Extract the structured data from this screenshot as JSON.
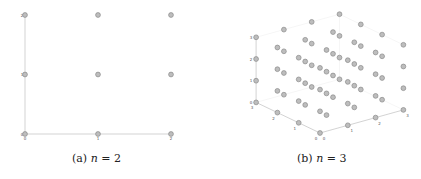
{
  "figure": {
    "panels": [
      {
        "id": "a",
        "caption_prefix": "(a)",
        "caption_var": "n",
        "caption_eq": " = 2"
      },
      {
        "id": "b",
        "caption_prefix": "(b)",
        "caption_var": "n",
        "caption_eq": " = 3"
      }
    ]
  },
  "colors": {
    "point_fill": "#bdbdbd",
    "point_stroke": "#8a8a8a",
    "axis": "#c8c8c8",
    "tick_text": "#555555"
  },
  "chart_data": [
    {
      "type": "scatter",
      "title": "(a) n = 2",
      "dimensions": 2,
      "x_ticks": [
        "0",
        "1",
        "2"
      ],
      "y_ticks": [
        "0",
        "1",
        "2"
      ],
      "xlim": [
        0,
        2
      ],
      "ylim": [
        0,
        2
      ],
      "grid": false,
      "points": [
        [
          0,
          0
        ],
        [
          1,
          0
        ],
        [
          2,
          0
        ],
        [
          0,
          1
        ],
        [
          1,
          1
        ],
        [
          2,
          1
        ],
        [
          0,
          2
        ],
        [
          1,
          2
        ],
        [
          2,
          2
        ]
      ]
    },
    {
      "type": "scatter",
      "title": "(b) n = 3",
      "dimensions": 3,
      "x_ticks": [
        "0",
        "1",
        "2",
        "3"
      ],
      "y_ticks": [
        "0",
        "1",
        "2",
        "3"
      ],
      "z_ticks": [
        "0",
        "1",
        "2",
        "3"
      ],
      "xlim": [
        0,
        3
      ],
      "ylim": [
        0,
        3
      ],
      "zlim": [
        0,
        3
      ],
      "grid": false,
      "points_description": "all integer lattice points (x,y,z) with x,y,z in {0,1,2,3} — 64 points"
    }
  ]
}
